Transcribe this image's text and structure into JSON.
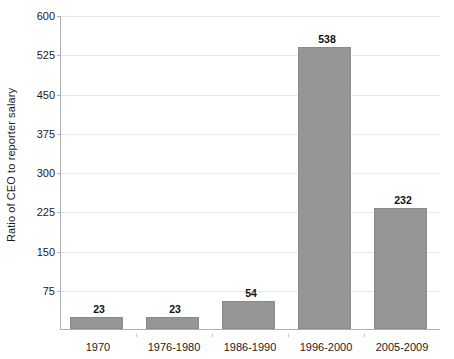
{
  "chart_data": {
    "type": "bar",
    "title": "",
    "subtitle": "",
    "xlabel": "",
    "ylabel": "Ratio of CEO to reporter salary",
    "categories": [
      "1970",
      "1976-1980",
      "1986-1990",
      "1996-2000",
      "2005-2009"
    ],
    "values": [
      23,
      23,
      54,
      538,
      232
    ],
    "value_labels": [
      "23",
      "23",
      "54",
      "538",
      "232"
    ],
    "series": [
      {
        "name": "Ratio of CEO to reporter salary",
        "values": [
          23,
          23,
          54,
          538,
          232
        ]
      }
    ],
    "ylim": [
      0,
      600
    ],
    "yticks": [
      75,
      150,
      225,
      300,
      375,
      450,
      525,
      600
    ],
    "ytick_labels": [
      "75",
      "150",
      "225",
      "300",
      "375",
      "450",
      "525",
      "600"
    ],
    "grid": "horizontal",
    "legend": "none",
    "bar_color": "#969696",
    "bar_border_color": "#8a8a8a",
    "gridline_color": "#e9e9e9",
    "axis_color": "#b0b0b0",
    "text_color": "#1a1a1a",
    "background_color": "#ffffff"
  }
}
